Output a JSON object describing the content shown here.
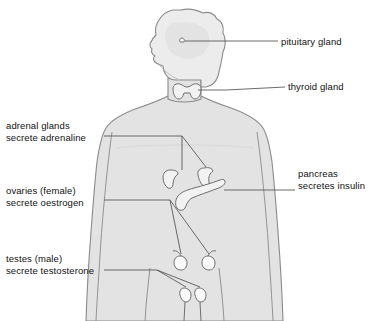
{
  "diagram": {
    "colors": {
      "body_fill": "#e3e3e3",
      "body_stroke": "#8a8a8a",
      "head_fill": "#ececec",
      "organ_fill": "#f2f2f2",
      "organ_stroke": "#6e6e6e",
      "leader_line": "#5a5a5a",
      "text": "#111111",
      "background": "#ffffff"
    },
    "labels": [
      {
        "id": "pituitary",
        "line1": "pituitary gland",
        "line2": ""
      },
      {
        "id": "thyroid",
        "line1": "thyroid gland",
        "line2": ""
      },
      {
        "id": "adrenal",
        "line1": "adrenal glands",
        "line2": "secrete adrenaline"
      },
      {
        "id": "ovaries",
        "line1": "ovaries (female)",
        "line2": "secrete oestrogen"
      },
      {
        "id": "testes",
        "line1": "testes (male)",
        "line2": "secrete testosterone"
      },
      {
        "id": "pancreas",
        "line1": "pancreas",
        "line2": "secretes insulin"
      }
    ]
  }
}
